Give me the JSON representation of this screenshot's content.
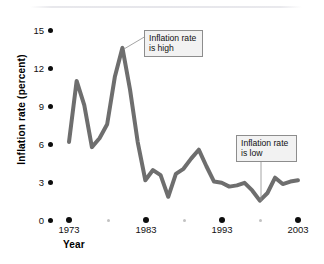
{
  "chart_data": {
    "type": "line",
    "title": "",
    "xlabel": "Year",
    "ylabel": "Inflation rate (percent)",
    "xlim": [
      1972,
      2004
    ],
    "ylim": [
      0,
      15.8
    ],
    "grid": false,
    "legend": null,
    "line_color": "#6e6e6e",
    "x": [
      1973,
      1974,
      1975,
      1976,
      1977,
      1978,
      1979,
      1980,
      1981,
      1982,
      1983,
      1984,
      1985,
      1986,
      1987,
      1988,
      1989,
      1990,
      1991,
      1992,
      1993,
      1994,
      1995,
      1996,
      1997,
      1998,
      1999,
      2000,
      2001,
      2002,
      2003
    ],
    "values": [
      6.2,
      11.0,
      9.1,
      5.8,
      6.5,
      7.6,
      11.3,
      13.6,
      10.3,
      6.2,
      3.2,
      4.0,
      3.6,
      1.9,
      3.7,
      4.1,
      4.9,
      5.6,
      4.3,
      3.1,
      3.0,
      2.7,
      2.8,
      3.0,
      2.4,
      1.6,
      2.2,
      3.4,
      2.9,
      3.1,
      3.2
    ],
    "y_ticks": [
      0,
      3,
      6,
      9,
      12,
      15
    ],
    "x_ticks_major": [
      1973,
      1983,
      1993,
      2003
    ],
    "x_ticks_minor": [
      1978,
      1988,
      1998
    ],
    "annotations": [
      {
        "id": "high",
        "lines": [
          "Inflation rate",
          "is high"
        ],
        "points_to_year": 1980,
        "points_to_value": 13.6
      },
      {
        "id": "low",
        "lines": [
          "Inflation rate",
          "is low"
        ],
        "points_to_year": 1998,
        "points_to_value": 1.6
      }
    ]
  }
}
